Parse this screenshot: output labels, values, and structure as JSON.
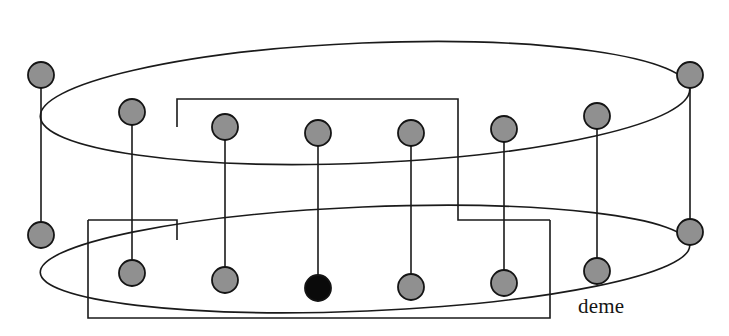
{
  "figure": {
    "type": "diagram",
    "background_color": "#ffffff",
    "stroke_color": "#1a1a1a",
    "node_fill_gray": "#909090",
    "node_fill_black": "#0a0a0a",
    "node_stroke": "#141414",
    "node_radius": 13,
    "line_width": 1.6,
    "labels": [
      {
        "id": "deme-label",
        "text": "deme",
        "x": 578,
        "y": 294,
        "font_size": 21
      }
    ],
    "ellipses": [
      {
        "id": "top-ring",
        "cx": 365,
        "cy": 103,
        "rx": 325,
        "ry": 60,
        "rotation": -2.4
      },
      {
        "id": "bottom-ring",
        "cx": 365,
        "cy": 259,
        "rx": 325,
        "ry": 52,
        "rotation": -2.4
      }
    ],
    "nodes": [
      {
        "id": "t0",
        "ring": "top",
        "x": 41,
        "y": 75,
        "fill": "gray"
      },
      {
        "id": "t1",
        "ring": "top",
        "x": 132,
        "y": 112,
        "fill": "gray"
      },
      {
        "id": "t2",
        "ring": "top",
        "x": 225,
        "y": 127,
        "fill": "gray"
      },
      {
        "id": "t3",
        "ring": "top",
        "x": 318,
        "y": 133,
        "fill": "gray"
      },
      {
        "id": "t4",
        "ring": "top",
        "x": 411,
        "y": 133,
        "fill": "gray"
      },
      {
        "id": "t5",
        "ring": "top",
        "x": 504,
        "y": 129,
        "fill": "gray"
      },
      {
        "id": "t6",
        "ring": "top",
        "x": 597,
        "y": 116,
        "fill": "gray"
      },
      {
        "id": "t7",
        "ring": "top",
        "x": 690,
        "y": 75,
        "fill": "gray"
      },
      {
        "id": "b0",
        "ring": "bottom",
        "x": 41,
        "y": 235,
        "fill": "gray"
      },
      {
        "id": "b1",
        "ring": "bottom",
        "x": 132,
        "y": 273,
        "fill": "gray"
      },
      {
        "id": "b2",
        "ring": "bottom",
        "x": 225,
        "y": 280,
        "fill": "gray"
      },
      {
        "id": "b3",
        "ring": "bottom",
        "x": 318,
        "y": 288,
        "fill": "black"
      },
      {
        "id": "b4",
        "ring": "bottom",
        "x": 411,
        "y": 287,
        "fill": "gray"
      },
      {
        "id": "b5",
        "ring": "bottom",
        "x": 504,
        "y": 283,
        "fill": "gray"
      },
      {
        "id": "b6",
        "ring": "bottom",
        "x": 597,
        "y": 271,
        "fill": "gray"
      },
      {
        "id": "b7",
        "ring": "bottom",
        "x": 690,
        "y": 232,
        "fill": "gray"
      }
    ],
    "vertical_connectors": [
      {
        "id": "v0",
        "x": 41,
        "y1": 75,
        "y2": 235
      },
      {
        "id": "v1",
        "x": 132,
        "y1": 112,
        "y2": 273
      },
      {
        "id": "v2",
        "x": 225,
        "y1": 127,
        "y2": 280
      },
      {
        "id": "v3",
        "x": 318,
        "y1": 133,
        "y2": 288
      },
      {
        "id": "v4",
        "x": 411,
        "y1": 133,
        "y2": 287
      },
      {
        "id": "v5",
        "x": 504,
        "y1": 129,
        "y2": 283
      },
      {
        "id": "v6",
        "x": 597,
        "y1": 116,
        "y2": 271
      },
      {
        "id": "v7",
        "x": 690,
        "y1": 75,
        "y2": 232
      }
    ],
    "rect_paths": [
      {
        "id": "upper-migration-path",
        "points": "177,127 177,99 458,99 458,220 550,220"
      },
      {
        "id": "lower-migration-path",
        "points": "88,220 177,220 177,240"
      },
      {
        "id": "lower-migration-loop",
        "points": "88,220 88,318 550,318 550,220"
      }
    ]
  }
}
